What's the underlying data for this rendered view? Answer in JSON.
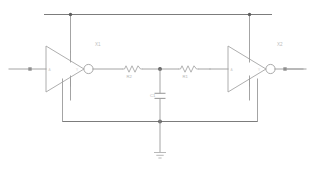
{
  "document": {
    "kind": "circuit-schematic",
    "background_color": "#ffffff",
    "line_color": "#9a9a9a",
    "node_color": "#5e5e5e",
    "label_color": "#b9b9b9"
  },
  "components": {
    "inverter_left": {
      "name": "inverter-left",
      "type": "inverter",
      "reference": "X1",
      "input_pin_label": "A",
      "output_pin_label": "Y",
      "power_pin_label": "VDD",
      "ground_pin_label": "VSS"
    },
    "inverter_right": {
      "name": "inverter-right",
      "type": "inverter",
      "reference": "X2",
      "input_pin_label": "A",
      "output_pin_label": "Y",
      "power_pin_label": "VDD",
      "ground_pin_label": "VSS"
    },
    "resistor_left": {
      "name": "resistor-r2",
      "type": "resistor",
      "reference": "R2"
    },
    "resistor_right": {
      "name": "resistor-r1",
      "type": "resistor",
      "reference": "R1"
    },
    "capacitor": {
      "name": "capacitor-c1",
      "type": "capacitor",
      "reference": "C1"
    },
    "ground": {
      "name": "ground-symbol",
      "type": "ground"
    }
  },
  "terminals": {
    "input": {
      "name": "input-terminal",
      "label": ""
    },
    "output": {
      "name": "output-terminal",
      "label": ""
    }
  },
  "nets": {
    "top_rail": {
      "name": "power-rail-top",
      "label": ""
    },
    "bottom_rail": {
      "name": "ground-rail-bottom",
      "label": ""
    },
    "mid_node": {
      "name": "rc-center-node",
      "label": ""
    }
  }
}
